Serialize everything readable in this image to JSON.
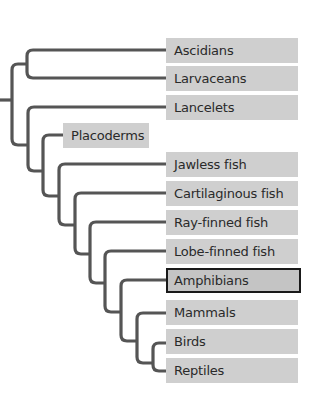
{
  "diagram": {
    "type": "phylogenetic-tree",
    "line_color": "#555555",
    "label_bg": "#cfcfcf",
    "highlight_border": "#1a1a1a",
    "taxa": [
      {
        "id": "ascidians",
        "label": "Ascidians"
      },
      {
        "id": "larvaceans",
        "label": "Larvaceans"
      },
      {
        "id": "lancelets",
        "label": "Lancelets"
      },
      {
        "id": "placoderms",
        "label": "Placoderms"
      },
      {
        "id": "jawless-fish",
        "label": "Jawless fish"
      },
      {
        "id": "cartilaginous-fish",
        "label": "Cartilaginous fish"
      },
      {
        "id": "ray-finned-fish",
        "label": "Ray-finned fish"
      },
      {
        "id": "lobe-finned-fish",
        "label": "Lobe-finned fish"
      },
      {
        "id": "amphibians",
        "label": "Amphibians",
        "highlighted": true
      },
      {
        "id": "mammals",
        "label": "Mammals"
      },
      {
        "id": "birds",
        "label": "Birds"
      },
      {
        "id": "reptiles",
        "label": "Reptiles"
      }
    ]
  }
}
